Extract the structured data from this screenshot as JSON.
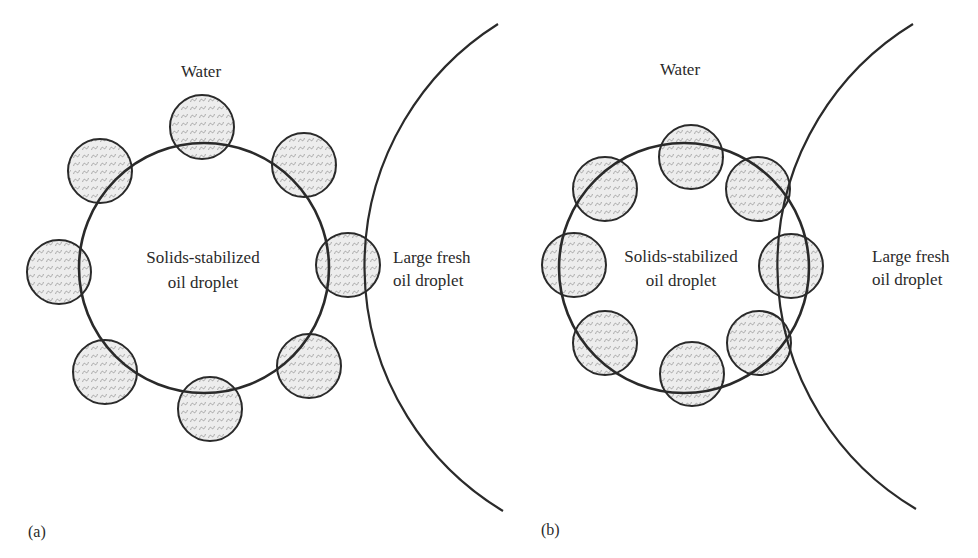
{
  "figure": {
    "colors": {
      "background": "#ffffff",
      "stroke": "#2a2a2a",
      "particle_fill": "#ececec",
      "particle_texture": "#a9a9a9"
    },
    "panels": [
      {
        "id": "a",
        "panel_label": "(a)",
        "medium_label": "Water",
        "small_droplet_label": [
          "Solids-stabilized",
          "oil droplet"
        ],
        "large_droplet_label": [
          "Large fresh",
          "oil droplet"
        ],
        "small_droplet": {
          "cx": 204,
          "cy": 268,
          "r": 125
        },
        "large_droplet_arc": {
          "cx": 652,
          "cy": 265,
          "r": 286,
          "from": [
            498,
            24
          ],
          "to": [
            503,
            511
          ]
        },
        "particles": [
          {
            "cx": 202,
            "cy": 127
          },
          {
            "cx": 304,
            "cy": 165
          },
          {
            "cx": 348,
            "cy": 265
          },
          {
            "cx": 309,
            "cy": 366
          },
          {
            "cx": 210,
            "cy": 409
          },
          {
            "cx": 105,
            "cy": 372
          },
          {
            "cx": 59,
            "cy": 272
          },
          {
            "cx": 100,
            "cy": 171
          }
        ],
        "particle_radius": 32,
        "particle_count": 8
      },
      {
        "id": "b",
        "panel_label": "(b)",
        "medium_label": "Water",
        "small_droplet_label": [
          "Solids-stabilized",
          "oil droplet"
        ],
        "large_droplet_label": [
          "Large fresh",
          "oil droplet"
        ],
        "small_droplet": {
          "cx": 684,
          "cy": 268,
          "r": 125
        },
        "large_droplet_arc": {
          "cx": 1060,
          "cy": 266,
          "r": 283,
          "from": [
            913,
            24
          ],
          "to": [
            916,
            509
          ]
        },
        "particles": [
          {
            "cx": 691,
            "cy": 157
          },
          {
            "cx": 758,
            "cy": 189
          },
          {
            "cx": 791,
            "cy": 266
          },
          {
            "cx": 759,
            "cy": 343
          },
          {
            "cx": 692,
            "cy": 374
          },
          {
            "cx": 605,
            "cy": 343
          },
          {
            "cx": 574,
            "cy": 265
          },
          {
            "cx": 605,
            "cy": 189
          }
        ],
        "particle_radius": 32,
        "particle_count": 8
      }
    ]
  }
}
